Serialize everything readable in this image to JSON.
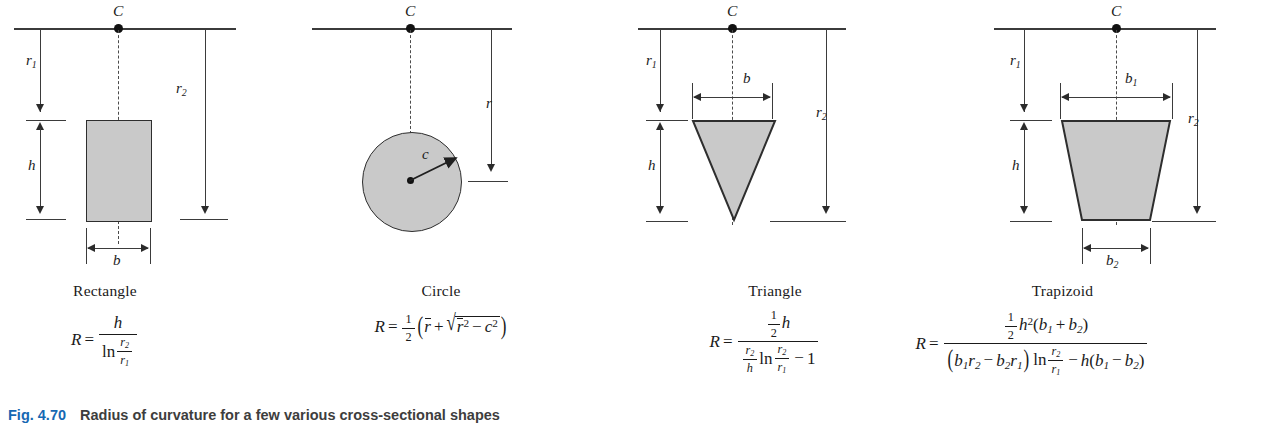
{
  "figure": {
    "caption_tag": "Fig. 4.70",
    "caption_text": "Radius of curvature for a few various cross-sectional shapes"
  },
  "common_labels": {
    "centroid": "C",
    "r1": "r",
    "r1_sub": "1",
    "r2": "r",
    "r2_sub": "2",
    "h": "h",
    "R": "R",
    "equals": "=",
    "ln": "ln"
  },
  "panels": [
    {
      "id": "rectangle",
      "shape_label": "Rectangle",
      "dimensions": [
        "r₁",
        "r₂",
        "h",
        "b"
      ],
      "width_label": "b",
      "formula_plain": "R = h / ln(r₂/r₁)",
      "formula_parts": {
        "lhs": "R",
        "numerator": "h",
        "den_ln": "ln",
        "den_num": "r",
        "den_num_sub": "2",
        "den_den": "r",
        "den_den_sub": "1"
      }
    },
    {
      "id": "circle",
      "shape_label": "Circle",
      "dimensions": [
        "r",
        "c"
      ],
      "radial_label": "c",
      "distance_label": "r",
      "formula_plain": "R = ½ ( r̄ + √(r̄² − c²) )",
      "formula_parts": {
        "lhs": "R",
        "half_num": "1",
        "half_den": "2",
        "rbar": "r",
        "plus": "+",
        "minus": "−",
        "c": "c",
        "sq": "2"
      }
    },
    {
      "id": "triangle",
      "shape_label": "Triangle",
      "dimensions": [
        "r₁",
        "r₂",
        "h",
        "b"
      ],
      "width_label": "b",
      "formula_plain": "R = (½ h) / ((r₂/h) ln(r₂/r₁) − 1)",
      "formula_parts": {
        "lhs": "R",
        "num_half_num": "1",
        "num_half_den": "2",
        "num_h": "h",
        "den_r2": "r",
        "den_r2_sub": "2",
        "den_h": "h",
        "den_ln": "ln",
        "den_ln_num": "r",
        "den_ln_num_sub": "2",
        "den_ln_den": "r",
        "den_ln_den_sub": "1",
        "den_minus": "−",
        "den_one": "1"
      }
    },
    {
      "id": "trapezoid",
      "shape_label": "Trapizoid",
      "dimensions": [
        "r₁",
        "r₂",
        "h",
        "b₁",
        "b₂"
      ],
      "top_width_label": "b",
      "top_width_sub": "1",
      "bottom_width_label": "b",
      "bottom_width_sub": "2",
      "formula_plain": "R = (½ h² (b₁ + b₂)) / ((b₁r₂ − b₂r₁) ln(r₂/r₁) − h(b₁ − b₂))",
      "formula_parts": {
        "lhs": "R",
        "half_num": "1",
        "half_den": "2",
        "h": "h",
        "h_pow": "2",
        "b1": "b",
        "b1_sub": "1",
        "b2": "b",
        "b2_sub": "2",
        "plus": "+",
        "minus": "−",
        "r1": "r",
        "r1_sub": "1",
        "r2": "r",
        "r2_sub": "2",
        "ln": "ln"
      }
    }
  ],
  "colors": {
    "shape_fill": "#c9c9c9",
    "shape_stroke": "#2e2e2e",
    "line": "#3b3b3b",
    "caption_tag": "#1668b3",
    "caption_text": "#3d3d3d"
  }
}
